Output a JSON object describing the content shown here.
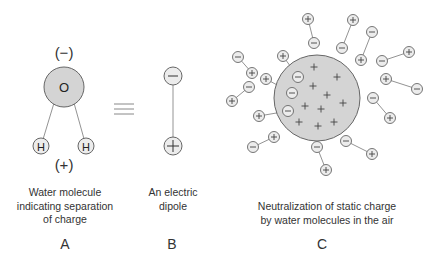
{
  "panels": {
    "A": {
      "letter": "A",
      "caption_lines": [
        "Water molecule",
        "indicating separation",
        "of charge"
      ],
      "top_charge": "(−)",
      "bottom_charge": "(+)",
      "oxygen_label": "O",
      "hydrogen_label": "H"
    },
    "equivalence_symbol": "≡",
    "B": {
      "letter": "B",
      "caption_lines": [
        "An electric",
        "dipole"
      ],
      "negative_symbol": "−",
      "positive_symbol": "+"
    },
    "C": {
      "letter": "C",
      "caption_lines": [
        "Neutralization of static charge",
        "by water molecules in the air"
      ],
      "charged_particle": {
        "cx": 317,
        "cy": 98,
        "r": 43
      },
      "inner_charges": [
        [
          314,
          67
        ],
        [
          337,
          77
        ],
        [
          313,
          86
        ],
        [
          327,
          95
        ],
        [
          343,
          103
        ],
        [
          305,
          106
        ],
        [
          321,
          109
        ],
        [
          299,
          122
        ],
        [
          318,
          126
        ],
        [
          334,
          122
        ]
      ],
      "dipoles": [
        {
          "plus": [
            308,
            19
          ],
          "minus": [
            314,
            43
          ]
        },
        {
          "plus": [
            353,
            20
          ],
          "minus": [
            342,
            48
          ]
        },
        {
          "plus": [
            361,
            60
          ],
          "minus": [
            372,
            32
          ]
        },
        {
          "plus": [
            409,
            52
          ],
          "minus": [
            382,
            61
          ]
        },
        {
          "plus": [
            386,
            79
          ],
          "minus": [
            417,
            89
          ]
        },
        {
          "plus": [
            390,
            118
          ],
          "minus": [
            373,
            98
          ]
        },
        {
          "plus": [
            372,
            154
          ],
          "minus": [
            346,
            141
          ]
        },
        {
          "plus": [
            326,
            170
          ],
          "minus": [
            317,
            147
          ]
        },
        {
          "plus": [
            274,
            137
          ],
          "minus": [
            253,
            147
          ]
        },
        {
          "plus": [
            259,
            116
          ],
          "minus": [
            288,
            111
          ]
        },
        {
          "plus": [
            266,
            79
          ],
          "minus": [
            292,
            93
          ]
        },
        {
          "plus": [
            283,
            56
          ],
          "minus": [
            298,
            77
          ]
        },
        {
          "plus": [
            252,
            73
          ],
          "minus": [
            238,
            57
          ]
        },
        {
          "plus": [
            232,
            101
          ],
          "minus": [
            249,
            87
          ]
        }
      ]
    }
  },
  "colors": {
    "fill_gray": "#d4d4d4",
    "ion_fill": "#ececec",
    "stroke": "#555555",
    "text": "#333333"
  }
}
